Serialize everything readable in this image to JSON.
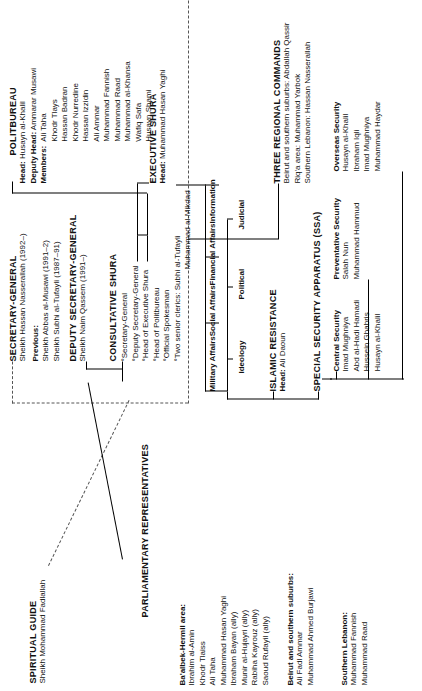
{
  "chart_title": "Hezbollah organizational structure",
  "spiritual_guide": {
    "title": "SPIRITUAL GUIDE",
    "name": "Sheikh Mohammad Fadlallah"
  },
  "secretary_general": {
    "title": "SECRETARY-GENERAL",
    "current": "Sheikh Hassan Nasserallah (1992–)",
    "previous_label": "Previous:",
    "previous": [
      "Sheikh Abbas al-Musawi (1991–2)",
      "Sheikh Subhi al-Tufayli (1987–91)"
    ]
  },
  "deputy_secretary_general": {
    "title": "DEPUTY SECRETARY-GENERAL",
    "name": "Sheikh Naim Qassem (1991–)"
  },
  "consultative_shura": {
    "title": "CONSULTATIVE SHURA",
    "members": [
      "°Secretary-General",
      "°Deputy Secretary-General",
      "°Head of Executive Shura",
      "°Head of Politbureau",
      "°Official Spokesman",
      "°Two senior clerics: Subhi al-Tufayli"
    ],
    "members_cont": "Muhammad al-Mikdad"
  },
  "politbureau": {
    "title": "POLITBUREAU",
    "head_label": "Head:",
    "head": "Husayn al-Khalil",
    "deputy_head_label": "Deputy Head:",
    "deputy_head": "Ammarar Musawi",
    "members_label": "Members:",
    "members": [
      "Ali Taha",
      "Khodr Tlays",
      "Hassan Badran",
      "Khodr Nurredine",
      "Hassan Izzidin",
      "Ali Ammar",
      "Muhammad Fannish",
      "Muhammad Raad",
      "Muhammad al-Khansa",
      "Wafiq Safa",
      "Husayn Shami"
    ]
  },
  "executive_shura": {
    "title": "EXECUTIVE SHURA",
    "head_label": "Head:",
    "head": "Muhammad Hasan Yaghi",
    "departments": [
      "Military Affairs",
      "Social Affairs",
      "Financial Affairs",
      "Information"
    ],
    "sub_departments": [
      "Ideology",
      "Political",
      "Judicial"
    ]
  },
  "regional_commands": {
    "title": "THREE REGIONAL COMMANDS",
    "entries": [
      "Beirut and southern suburbs: Abdallah Qassir",
      "Riq'a area: Muhammad Yarbok",
      "Southern Lebanon: Hassan Nasserallah"
    ]
  },
  "islamic_resistance": {
    "title": "ISLAMIC RESISTANCE",
    "head_label": "Head:",
    "head": "Ali Daoun"
  },
  "special_security_apparatus": {
    "title": "SPECIAL SECURITY APPARATUS (SSA)",
    "units": [
      {
        "name": "Central Security",
        "members": [
          "Imad Mughniya",
          "Abd al-Hadi Hamadi",
          "Hussein Ghabris",
          "Husayn al-Khalil"
        ]
      },
      {
        "name": "Preventative Security",
        "members": [
          "Salah Nun",
          "Muhammad Hammud"
        ]
      },
      {
        "name": "Overseas Security",
        "members": [
          "Husayn al-Khalil",
          "Ibraham Iqli",
          "Imad Mughniya",
          "Muhammad Haydar"
        ]
      }
    ]
  },
  "parliamentary_representatives": {
    "title": "PARLIAMENTARY REPRESENTATIVES",
    "groups": [
      {
        "name": "Ba'albek-Hermil area:",
        "members": [
          "Ibrahim al-Amin",
          "Khodr Tlaiss",
          "Ali Taha",
          "Muhammad Hasan Yaghi",
          "Ibraham Bayan (ally)",
          "Munir al-Hujayri (ally)",
          "Rabiha Kayrouz (ally)",
          "Saoud Rufayil (ally)"
        ]
      },
      {
        "name": "Beirut and southern suburbs:",
        "members": [
          "Ali Fadl Ammar",
          "Muhammad Ahmed Burjawi"
        ]
      },
      {
        "name": "Southern Lebanon:",
        "members": [
          "Muhammad Fannish",
          "Muhammad Raad"
        ]
      }
    ]
  }
}
